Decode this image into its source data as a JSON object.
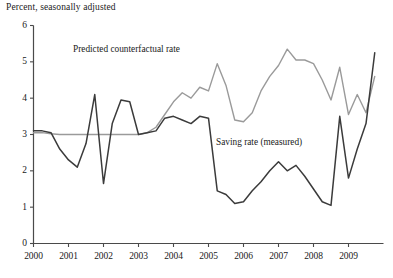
{
  "figure": {
    "axis_title": "Percent, seasonally adjusted",
    "background_color": "#ffffff"
  },
  "annotations": {
    "predicted_label": "Predicted counterfactual rate",
    "measured_label": "Saving rate (measured)"
  },
  "chart_data": {
    "type": "line",
    "title": "",
    "subtitle": "",
    "xlabel": "",
    "ylabel": "Percent, seasonally adjusted",
    "xlim": [
      2000.0,
      2010.0
    ],
    "ylim": [
      0,
      6
    ],
    "grid": false,
    "legend_position": "inline-annotation",
    "yticks": [
      0,
      1,
      2,
      3,
      4,
      5,
      6
    ],
    "ytick_labels": [
      "0",
      "1",
      "2",
      "3",
      "4",
      "5",
      "6"
    ],
    "xticks": [
      2000,
      2001,
      2002,
      2003,
      2004,
      2005,
      2006,
      2007,
      2008,
      2009
    ],
    "xtick_labels": [
      "2000",
      "2001",
      "2002",
      "2003",
      "2004",
      "2005",
      "2006",
      "2007",
      "2008",
      "2009"
    ],
    "x": [
      2000.0,
      2000.25,
      2000.5,
      2000.75,
      2001.0,
      2001.25,
      2001.5,
      2001.75,
      2002.0,
      2002.25,
      2002.5,
      2002.75,
      2003.0,
      2003.25,
      2003.5,
      2003.75,
      2004.0,
      2004.25,
      2004.5,
      2004.75,
      2005.0,
      2005.25,
      2005.5,
      2005.75,
      2006.0,
      2006.25,
      2006.5,
      2006.75,
      2007.0,
      2007.25,
      2007.5,
      2007.75,
      2008.0,
      2008.25,
      2008.5,
      2008.75,
      2009.0,
      2009.25,
      2009.5,
      2009.75
    ],
    "series": [
      {
        "name": "Saving rate (measured)",
        "color": "#3b3b3b",
        "values": [
          3.1,
          3.1,
          3.05,
          2.6,
          2.3,
          2.1,
          2.75,
          4.1,
          1.65,
          3.3,
          3.95,
          3.9,
          3.0,
          3.05,
          3.1,
          3.45,
          3.5,
          3.4,
          3.3,
          3.5,
          3.45,
          1.45,
          1.35,
          1.1,
          1.15,
          1.45,
          1.7,
          2.0,
          2.25,
          2.0,
          2.15,
          1.85,
          1.5,
          1.15,
          1.05,
          3.5,
          1.8,
          2.6,
          3.3,
          5.25
        ]
      },
      {
        "name": "Predicted counterfactual rate",
        "color": "#9a9a9a",
        "values": [
          3.05,
          3.05,
          3.02,
          3.0,
          3.0,
          3.0,
          3.0,
          3.0,
          3.0,
          3.0,
          3.0,
          3.0,
          3.0,
          3.05,
          3.2,
          3.55,
          3.9,
          4.15,
          4.0,
          4.3,
          4.2,
          4.95,
          4.35,
          3.4,
          3.35,
          3.6,
          4.2,
          4.6,
          4.9,
          5.35,
          5.05,
          5.05,
          4.95,
          4.5,
          3.95,
          4.85,
          3.55,
          4.1,
          3.6,
          4.6
        ]
      }
    ]
  }
}
